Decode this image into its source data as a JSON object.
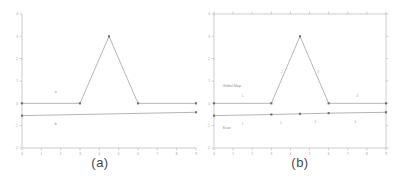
{
  "figure": {
    "panels": [
      {
        "id": "a",
        "caption": "(a)",
        "frame_style": "open-axes",
        "series_labels": [
          "a",
          "b"
        ]
      },
      {
        "id": "b",
        "caption": "(b)",
        "frame_style": "box",
        "series_labels": [
          "Global Map",
          "Scan"
        ]
      }
    ]
  },
  "chart_data": [
    {
      "type": "line",
      "title": "(a)",
      "xlabel": "",
      "ylabel": "",
      "xlim": [
        0,
        9
      ],
      "ylim": [
        -2,
        4
      ],
      "xticks": [
        0,
        1,
        2,
        3,
        4,
        5,
        6,
        7,
        8,
        9
      ],
      "xticklabels": [
        "0",
        "1",
        "2",
        "3",
        "4",
        "5",
        "6",
        "7",
        "8",
        "9"
      ],
      "yticks": [
        -2,
        -1,
        0,
        1,
        2,
        3,
        4
      ],
      "yticklabels": [
        "-2",
        "-1",
        "0",
        "1",
        "2",
        "3",
        "4"
      ],
      "grid": false,
      "legend": "inline-annotation",
      "series": [
        {
          "name": "a",
          "label_text": "a",
          "label_x": 1.7,
          "label_y": 0.45,
          "markers": true,
          "x": [
            0,
            3,
            4.5,
            6,
            9
          ],
          "y": [
            0,
            0,
            3,
            0,
            0
          ]
        },
        {
          "name": "b",
          "label_text": "b",
          "label_x": 1.7,
          "label_y": -0.95,
          "markers": true,
          "x": [
            0,
            9
          ],
          "y": [
            -0.55,
            -0.4
          ]
        }
      ]
    },
    {
      "type": "line",
      "title": "(b)",
      "xlabel": "",
      "ylabel": "",
      "xlim": [
        0,
        9
      ],
      "ylim": [
        -2,
        4
      ],
      "xticks": [
        0,
        1,
        2,
        3,
        4,
        5,
        6,
        7,
        8,
        9
      ],
      "xticklabels": [
        "0",
        "1",
        "2",
        "3",
        "4",
        "5",
        "6",
        "7",
        "8",
        "9"
      ],
      "yticks": [
        -2,
        -1,
        0,
        1,
        2,
        3,
        4
      ],
      "yticklabels": [
        "-2",
        "-1",
        "0",
        "1",
        "2",
        "3",
        "4"
      ],
      "grid": false,
      "legend": "inline-annotation",
      "series": [
        {
          "name": "Global Map",
          "label_text": "Global Map",
          "label_x": 0.45,
          "label_y": 0.72,
          "markers": true,
          "x": [
            0,
            3,
            4.5,
            6,
            9
          ],
          "y": [
            0,
            0,
            3,
            0,
            0
          ],
          "point_labels": [
            {
              "text": "1",
              "x": 1.5,
              "y": 0.3
            },
            {
              "text": "2",
              "x": 3.55,
              "y": 1.35
            },
            {
              "text": "3",
              "x": 5.45,
              "y": 1.35
            },
            {
              "text": "4",
              "x": 7.5,
              "y": 0.3
            }
          ]
        },
        {
          "name": "Scan",
          "label_text": "Scan",
          "label_x": 0.45,
          "label_y": -1.15,
          "markers": true,
          "x": [
            0,
            3,
            4.5,
            6,
            9
          ],
          "y": [
            -0.55,
            -0.5,
            -0.47,
            -0.44,
            -0.4
          ],
          "point_labels": [
            {
              "text": "1",
              "x": 1.5,
              "y": -0.95
            },
            {
              "text": "2",
              "x": 3.5,
              "y": -0.92
            },
            {
              "text": "3",
              "x": 5.3,
              "y": -0.9
            },
            {
              "text": "4",
              "x": 7.4,
              "y": -0.88
            }
          ]
        }
      ]
    }
  ]
}
